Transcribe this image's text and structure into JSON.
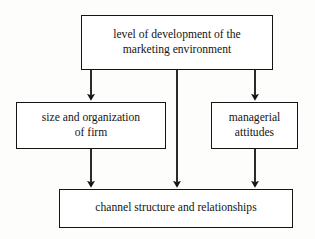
{
  "diagram": {
    "type": "flowchart",
    "title": "",
    "background_color": "#fdfdfc",
    "line_color": "#141414",
    "box_fill_color": "#ffffff",
    "nodes": [
      {
        "id": "environment",
        "label": "level of development of the\nmarketing environment",
        "role": "source"
      },
      {
        "id": "firm",
        "label": "size and organization\nof firm",
        "role": "intermediate"
      },
      {
        "id": "managerial",
        "label": "managerial\nattitudes",
        "role": "intermediate"
      },
      {
        "id": "channel",
        "label": "channel structure and relationships",
        "role": "outcome"
      }
    ],
    "edges": [
      {
        "id": "edge-environment-firm",
        "from": "environment",
        "to": "firm",
        "style": "solid-arrow"
      },
      {
        "id": "edge-environment-channel",
        "from": "environment",
        "to": "channel",
        "style": "solid-arrow"
      },
      {
        "id": "edge-environment-managerial",
        "from": "environment",
        "to": "managerial",
        "style": "solid-arrow"
      },
      {
        "id": "edge-firm-channel",
        "from": "firm",
        "to": "channel",
        "style": "solid-arrow"
      },
      {
        "id": "edge-managerial-channel",
        "from": "managerial",
        "to": "channel",
        "style": "solid-arrow"
      }
    ]
  }
}
